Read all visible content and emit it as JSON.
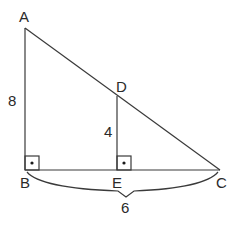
{
  "diagram": {
    "points": {
      "A": {
        "label": "A",
        "x": 25,
        "y": 28
      },
      "B": {
        "label": "B",
        "x": 25,
        "y": 170
      },
      "C": {
        "label": "C",
        "x": 220,
        "y": 170
      },
      "D": {
        "label": "D",
        "x": 117,
        "y": 96
      },
      "E": {
        "label": "E",
        "x": 117,
        "y": 170
      }
    },
    "segments": [
      "AB",
      "BC",
      "AC",
      "DE"
    ],
    "right_angles": [
      "B",
      "E"
    ],
    "measurements": {
      "AB": "8",
      "DE": "4",
      "BC": "6"
    }
  }
}
